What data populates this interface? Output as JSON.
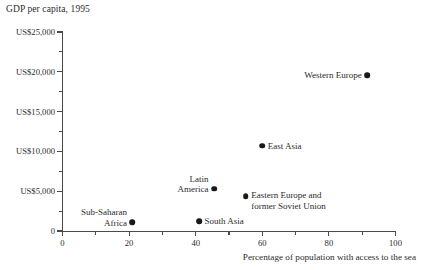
{
  "chart_data": {
    "type": "scatter",
    "title": "GDP per capita, 1995",
    "xlabel": "Percentage of population with access to the sea",
    "ylabel": "GDP per capita, 1995",
    "xlim": [
      0,
      100
    ],
    "ylim": [
      0,
      25000
    ],
    "grid": false,
    "legend": "none",
    "x_ticks": [
      {
        "value": 0,
        "label": "0",
        "major": true
      },
      {
        "value": 10,
        "label": "",
        "major": false
      },
      {
        "value": 20,
        "label": "20",
        "major": true
      },
      {
        "value": 30,
        "label": "",
        "major": false
      },
      {
        "value": 40,
        "label": "40",
        "major": true
      },
      {
        "value": 50,
        "label": "",
        "major": false
      },
      {
        "value": 60,
        "label": "60",
        "major": true
      },
      {
        "value": 70,
        "label": "",
        "major": false
      },
      {
        "value": 80,
        "label": "80",
        "major": true
      },
      {
        "value": 90,
        "label": "",
        "major": false
      },
      {
        "value": 100,
        "label": "100",
        "major": true
      }
    ],
    "y_ticks": [
      {
        "value": 0,
        "label": "0",
        "major": true
      },
      {
        "value": 2500,
        "label": "",
        "major": false
      },
      {
        "value": 5000,
        "label": "US$5,000",
        "major": true
      },
      {
        "value": 7500,
        "label": "",
        "major": false
      },
      {
        "value": 10000,
        "label": "US$10,000",
        "major": true
      },
      {
        "value": 12500,
        "label": "",
        "major": false
      },
      {
        "value": 15000,
        "label": "US$15,000",
        "major": true
      },
      {
        "value": 17500,
        "label": "",
        "major": false
      },
      {
        "value": 20000,
        "label": "US$20,000",
        "major": true
      },
      {
        "value": 22500,
        "label": "",
        "major": false
      },
      {
        "value": 25000,
        "label": "US$25,000",
        "major": true
      }
    ],
    "points": [
      {
        "name": "Western Europe",
        "label": "Western Europe",
        "x": 91.5,
        "y": 19600,
        "label_position": "left-of",
        "label_lines": [
          "Western Europe"
        ]
      },
      {
        "name": "East Asia",
        "label": "East Asia",
        "x": 60,
        "y": 10700,
        "label_position": "right-of",
        "label_lines": [
          "East Asia"
        ]
      },
      {
        "name": "Latin America",
        "label": "Latin America",
        "x": 45.5,
        "y": 5300,
        "label_position": "block-left",
        "label_lines": [
          "Latin",
          "America"
        ]
      },
      {
        "name": "Eastern Europe and former Soviet Union",
        "label": "Eastern Europe and former Soviet Union",
        "x": 55,
        "y": 4400,
        "label_position": "block-right",
        "label_lines": [
          "Eastern Europe and",
          "former Soviet Union"
        ]
      },
      {
        "name": "South Asia",
        "label": "South Asia",
        "x": 41,
        "y": 1250,
        "label_position": "right-of",
        "label_lines": [
          "South Asia"
        ]
      },
      {
        "name": "Sub-Saharan Africa",
        "label": "Sub-Saharan Africa",
        "x": 21,
        "y": 1100,
        "label_position": "block-left",
        "label_lines": [
          "Sub-Saharan",
          "Africa"
        ]
      }
    ],
    "colors": {
      "point": "#191919",
      "axis": "#4a4a4a",
      "text": "#2b2b2b",
      "background": "#ffffff"
    }
  }
}
